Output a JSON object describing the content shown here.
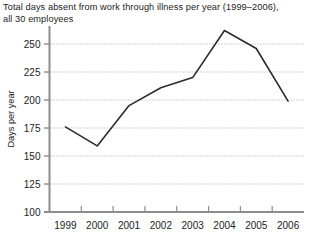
{
  "chart_data": {
    "type": "line",
    "title": "Total days absent from work through illness per year (1999–2006),\nall 30 employees",
    "xlabel": "",
    "ylabel": "Days per year",
    "categories": [
      "1999",
      "2000",
      "2001",
      "2002",
      "2003",
      "2004",
      "2005",
      "2006"
    ],
    "x": [
      1999,
      2000,
      2001,
      2002,
      2003,
      2004,
      2005,
      2006
    ],
    "values": [
      176,
      159,
      195,
      211,
      220,
      262,
      246,
      199
    ],
    "series": [
      {
        "name": "Days absent",
        "values": [
          176,
          159,
          195,
          211,
          220,
          262,
          246,
          199
        ]
      }
    ],
    "ylim": [
      100,
      262
    ],
    "yticks": [
      100,
      125,
      150,
      175,
      200,
      225,
      250
    ],
    "ytick_labels": [
      "100",
      "125",
      "150",
      "175",
      "200",
      "225",
      "250"
    ],
    "grid": true,
    "grid_axis": "y",
    "grid_style": "dotted",
    "legend": "none",
    "line_color": "#2b2b2b",
    "grid_color": "#9a9a9a",
    "axis_color": "#8c8c8c",
    "text_color": "#222222",
    "background_color": "#ffffff"
  },
  "axes": {
    "y_title": "Days per year",
    "y_ticks": [
      {
        "label": "250",
        "value": 250
      },
      {
        "label": "225",
        "value": 225
      },
      {
        "label": "200",
        "value": 200
      },
      {
        "label": "175",
        "value": 175
      },
      {
        "label": "150",
        "value": 150
      },
      {
        "label": "125",
        "value": 125
      },
      {
        "label": "100",
        "value": 100
      }
    ],
    "x_ticks": [
      {
        "label": "1999",
        "value": 1999
      },
      {
        "label": "2000",
        "value": 2000
      },
      {
        "label": "2001",
        "value": 2001
      },
      {
        "label": "2002",
        "value": 2002
      },
      {
        "label": "2003",
        "value": 2003
      },
      {
        "label": "2004",
        "value": 2004
      },
      {
        "label": "2005",
        "value": 2005
      },
      {
        "label": "2006",
        "value": 2006
      }
    ]
  }
}
